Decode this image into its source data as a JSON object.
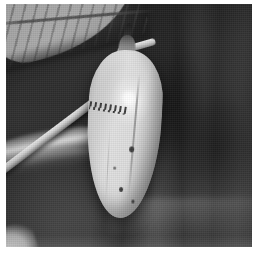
{
  "image": {
    "subject": "butterfly-chrysalis",
    "scene_description": "Black and white close-up photograph of a butterfly chrysalis hanging from a thin plant stem, with a serrated leaf at the upper left and a dark out-of-focus foliage background.",
    "medium": "grayscale-photograph",
    "orientation": "square",
    "width": 253,
    "height": 253,
    "border": {
      "color": "#ffffff",
      "left_px": 6,
      "top_px": 4,
      "right_px": 1,
      "bottom_px": 6
    },
    "palette": {
      "paper_white": "#ffffff",
      "background_dark": "#2b2b2b",
      "background_mid": "#474747",
      "chrysalis_light": "#e0e0e0",
      "chrysalis_shadow": "#6f6f6f",
      "highlight_white": "#ffffff",
      "stem_light": "#e8e8e8",
      "leaf_gray": "#bdbdbd",
      "marking_dark": "#1c1c1c"
    },
    "elements": [
      {
        "name": "chrysalis",
        "label": "Chrysalis (pupa)",
        "position": "center",
        "tone": "light gray"
      },
      {
        "name": "cremaster",
        "label": "Silk attachment point",
        "position": "top of chrysalis",
        "tone": "near black"
      },
      {
        "name": "specular-highlight",
        "label": "Light reflection",
        "position": "upper body of chrysalis",
        "tone": "white"
      },
      {
        "name": "dark-band",
        "label": "Dotted dark band",
        "position": "upper third of chrysalis",
        "tone": "dark gray"
      },
      {
        "name": "stem",
        "label": "Plant stem",
        "position": "diagonal upper left to center",
        "tone": "light gray"
      },
      {
        "name": "leaf-upper",
        "label": "Serrated leaf with veins",
        "position": "upper left corner",
        "tone": "medium gray"
      },
      {
        "name": "leaf-lower",
        "label": "Blurred leaf blade",
        "position": "middle left",
        "tone": "light gray"
      },
      {
        "name": "background",
        "label": "Out-of-focus foliage",
        "position": "full frame",
        "tone": "dark gray"
      }
    ]
  }
}
